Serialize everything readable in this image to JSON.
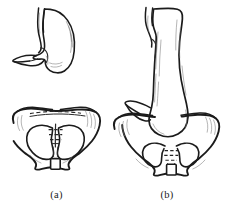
{
  "figure": {
    "type": "medical-line-drawing",
    "background_color": "#ffffff",
    "ink_color": "#1b1b1b",
    "shading_color": "#777777"
  },
  "panels": [
    {
      "id": "a",
      "caption": "(a)",
      "condition": "normal stomach",
      "organs": [
        {
          "name": "esophagus",
          "label": "esophagus"
        },
        {
          "name": "stomach",
          "label": "stomach"
        },
        {
          "name": "duodenum",
          "label": "duodenum"
        },
        {
          "name": "pelvis",
          "label": "pelvis"
        }
      ]
    },
    {
      "id": "b",
      "caption": "(b)",
      "condition": "gastroptosis, stomach descended into pelvic cavity",
      "organs": [
        {
          "name": "esophagus",
          "label": "esophagus"
        },
        {
          "name": "stomach",
          "label": "stomach"
        },
        {
          "name": "duodenum",
          "label": "duodenum"
        },
        {
          "name": "pelvis",
          "label": "pelvis"
        }
      ]
    }
  ]
}
